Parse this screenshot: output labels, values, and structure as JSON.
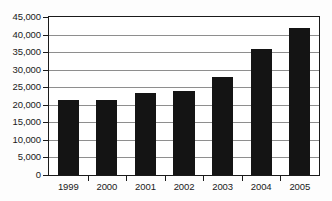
{
  "chart_data": {
    "type": "bar",
    "title": "",
    "subtitle": "",
    "xlabel": "",
    "ylabel": "",
    "categories": [
      "1999",
      "2000",
      "2001",
      "2002",
      "2003",
      "2004",
      "2005"
    ],
    "values": [
      21500,
      21500,
      23500,
      24000,
      28000,
      35800,
      41800
    ],
    "ylim": [
      0,
      45000
    ],
    "ytick_values": [
      0,
      5000,
      10000,
      15000,
      20000,
      25000,
      30000,
      35000,
      40000,
      45000
    ],
    "ytick_labels": [
      "0",
      "5,000",
      "10,000",
      "15,000",
      "20,000",
      "25,000",
      "30,000",
      "35,000",
      "40,000",
      "45,000"
    ],
    "grid": true,
    "legend": false,
    "legend_position": "none",
    "annotations": [],
    "bar_color": "#141414",
    "gridline_color": "#8e8e8e",
    "axis_color": "#1a1a1a",
    "background_color": "#ffffff"
  }
}
